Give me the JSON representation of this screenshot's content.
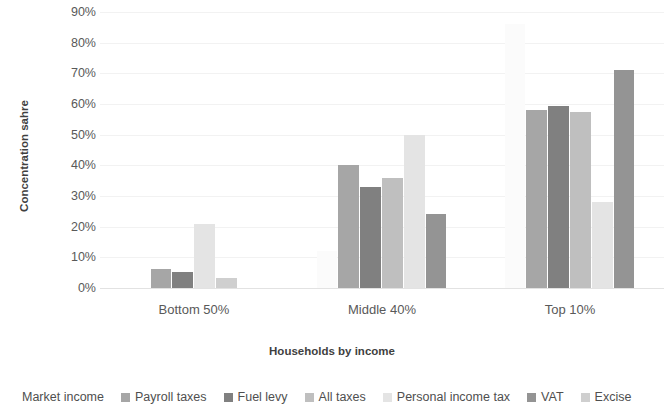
{
  "chart_data": {
    "type": "bar",
    "title": "",
    "xlabel": "Households by income",
    "ylabel": "Concentration sahre",
    "categories": [
      "Bottom 50%",
      "Middle 40%",
      "Top 10%"
    ],
    "ylim": [
      0,
      90
    ],
    "ytick_labels": [
      "0%",
      "10%",
      "20%",
      "30%",
      "40%",
      "50%",
      "60%",
      "70%",
      "80%",
      "90%"
    ],
    "ytick_values": [
      0,
      10,
      20,
      30,
      40,
      50,
      60,
      70,
      80,
      90
    ],
    "grid": true,
    "legend_position": "bottom",
    "series": [
      {
        "name": "Market income",
        "color": "#fbfbfb",
        "values": [
          0,
          12,
          86.0
        ]
      },
      {
        "name": "Payroll taxes",
        "color": "#a6a6a6",
        "values": [
          6.2,
          40.0,
          58.0
        ]
      },
      {
        "name": "Fuel levy",
        "color": "#808080",
        "values": [
          5.3,
          33.0,
          59.2
        ]
      },
      {
        "name": "All taxes",
        "color": "#bfbfbf",
        "values": [
          0,
          36.0,
          57.5
        ]
      },
      {
        "name": "Personal income tax",
        "color": "#e4e4e4",
        "values": [
          21.0,
          50.0,
          28.2
        ]
      },
      {
        "name": "VAT",
        "color": "#949494",
        "values": [
          0,
          24.0,
          71.0
        ]
      },
      {
        "name": "Excise",
        "color": "#cfcfcf",
        "values": [
          3.2,
          0,
          0
        ]
      }
    ]
  },
  "legend": {
    "items": [
      {
        "label": "Market income"
      },
      {
        "label": "Payroll taxes"
      },
      {
        "label": "Fuel levy"
      },
      {
        "label": "All taxes"
      },
      {
        "label": "Personal income tax"
      },
      {
        "label": "VAT"
      },
      {
        "label": "Excise"
      }
    ]
  }
}
